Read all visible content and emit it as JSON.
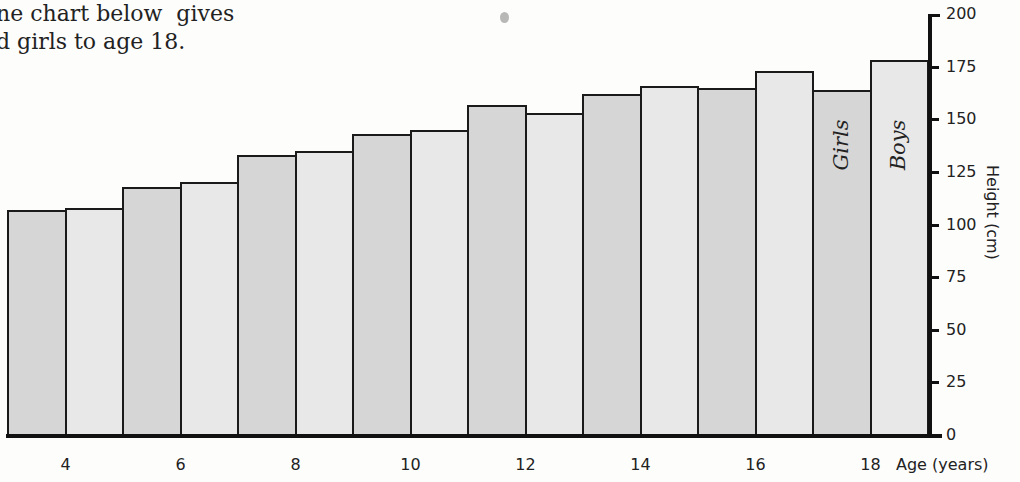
{
  "intro_text": {
    "line1": "ne chart below  gives",
    "line2": "d girls to age 18."
  },
  "chart_data": {
    "type": "bar",
    "title": "",
    "xlabel": "Age (years)",
    "ylabel": "Height (cm)",
    "ylim": [
      0,
      200
    ],
    "yticks": [
      0,
      25,
      50,
      75,
      100,
      125,
      150,
      175,
      200
    ],
    "categories": [
      "4",
      "6",
      "8",
      "10",
      "12",
      "14",
      "16",
      "18"
    ],
    "series": [
      {
        "name": "Girls",
        "color": "#d6d6d6",
        "values": [
          107,
          118,
          133,
          143,
          157,
          162,
          165,
          164
        ]
      },
      {
        "name": "Boys",
        "color": "#e8e8e8",
        "values": [
          108,
          120,
          135,
          145,
          153,
          166,
          173,
          178
        ]
      }
    ],
    "grid": false,
    "legend": "inline labels on last bars (Girls, Boys)"
  }
}
